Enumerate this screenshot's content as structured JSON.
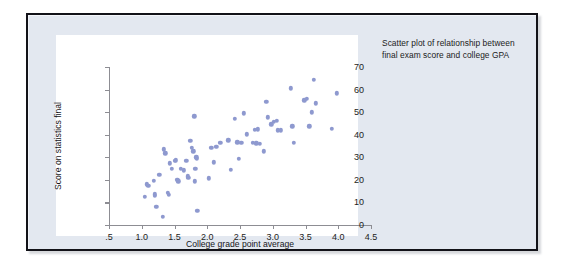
{
  "figure": {
    "caption": "Scatter plot of relationship between final exam score and college GPA",
    "frame_color": "#121218",
    "frame_fill": "#e3e8f0",
    "panel_fill": "#ffffff"
  },
  "chart_data": {
    "type": "scatter",
    "title": "",
    "xlabel": "College grade point average",
    "ylabel": "Score on statistics final",
    "xlim": [
      0.5,
      4.5
    ],
    "ylim": [
      0,
      70
    ],
    "xticks": [
      0.5,
      1.0,
      1.5,
      2.0,
      2.5,
      3.0,
      3.5,
      4.0,
      4.5
    ],
    "xticklabels": [
      ".5",
      "1.0",
      "1.5",
      "2.0",
      "2.5",
      "3.0",
      "3.5",
      "4.0",
      "4.5"
    ],
    "yticks": [
      0,
      10,
      20,
      30,
      40,
      50,
      60,
      70
    ],
    "yticklabels": [
      "0",
      "10",
      "20",
      "30",
      "40",
      "50",
      "60",
      "70"
    ],
    "grid": false,
    "legend": null,
    "marker_color": "#8e99cf",
    "marker_size": 4.4,
    "points": [
      [
        1.05,
        12.4
      ],
      [
        1.08,
        18.1
      ],
      [
        1.1,
        17.3
      ],
      [
        1.18,
        19.5
      ],
      [
        1.2,
        13.6
      ],
      [
        1.2,
        12.9
      ],
      [
        1.22,
        8.0
      ],
      [
        1.27,
        22.3
      ],
      [
        1.32,
        3.6
      ],
      [
        1.34,
        33.6
      ],
      [
        1.36,
        31.8
      ],
      [
        1.4,
        14.2
      ],
      [
        1.41,
        13.4
      ],
      [
        1.43,
        27.4
      ],
      [
        1.46,
        24.9
      ],
      [
        1.5,
        28.4
      ],
      [
        1.52,
        28.6
      ],
      [
        1.54,
        19.9
      ],
      [
        1.56,
        19.3
      ],
      [
        1.6,
        24.8
      ],
      [
        1.64,
        24.2
      ],
      [
        1.68,
        28.4
      ],
      [
        1.7,
        21.6
      ],
      [
        1.71,
        20.9
      ],
      [
        1.74,
        37.2
      ],
      [
        1.76,
        34.2
      ],
      [
        1.79,
        32.7
      ],
      [
        1.8,
        48.2
      ],
      [
        1.81,
        19.4
      ],
      [
        1.82,
        25.0
      ],
      [
        1.83,
        30.0
      ],
      [
        1.84,
        29.3
      ],
      [
        1.85,
        6.4
      ],
      [
        2.02,
        20.7
      ],
      [
        2.06,
        34.1
      ],
      [
        2.1,
        27.7
      ],
      [
        2.14,
        34.6
      ],
      [
        2.2,
        36.3
      ],
      [
        2.32,
        37.6
      ],
      [
        2.36,
        24.5
      ],
      [
        2.42,
        47.1
      ],
      [
        2.46,
        36.6
      ],
      [
        2.48,
        29.3
      ],
      [
        2.52,
        36.4
      ],
      [
        2.56,
        49.4
      ],
      [
        2.6,
        40.1
      ],
      [
        2.7,
        36.3
      ],
      [
        2.73,
        42.1
      ],
      [
        2.75,
        36.2
      ],
      [
        2.77,
        42.4
      ],
      [
        2.8,
        36.1
      ],
      [
        2.86,
        32.6
      ],
      [
        2.9,
        54.7
      ],
      [
        2.92,
        47.7
      ],
      [
        2.98,
        44.6
      ],
      [
        3.02,
        45.8
      ],
      [
        3.06,
        46.2
      ],
      [
        3.08,
        42.0
      ],
      [
        3.12,
        41.9
      ],
      [
        3.28,
        60.5
      ],
      [
        3.3,
        43.8
      ],
      [
        3.32,
        36.3
      ],
      [
        3.48,
        55.2
      ],
      [
        3.52,
        55.8
      ],
      [
        3.56,
        43.7
      ],
      [
        3.6,
        50.0
      ],
      [
        3.63,
        64.4
      ],
      [
        3.66,
        53.9
      ],
      [
        3.9,
        42.5
      ],
      [
        3.98,
        58.4
      ]
    ]
  }
}
